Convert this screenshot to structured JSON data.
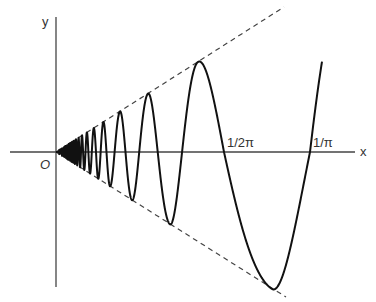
{
  "figure": {
    "function": "y = x sin(1/x)",
    "axes": {
      "x_label": "x",
      "y_label": "y",
      "origin_label": "O"
    },
    "tick_labels": [
      {
        "text": "1/2π",
        "value": "1/(2π)"
      },
      {
        "text": "1/π",
        "value": "1/π"
      }
    ],
    "envelope": {
      "upper": "y = x",
      "lower": "y = -x",
      "style": "dashed"
    },
    "colors": {
      "curve": "#111111",
      "axis": "#444444",
      "envelope": "#444444",
      "background": "#ffffff"
    }
  }
}
